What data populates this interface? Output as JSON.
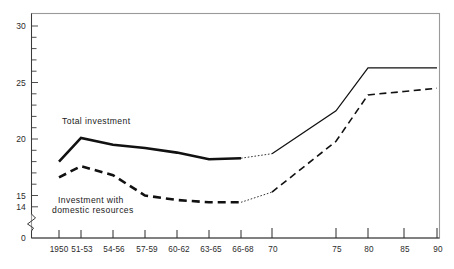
{
  "chart_data": {
    "type": "line",
    "title": "",
    "subtitle": "",
    "xlabel": "",
    "ylabel": "",
    "grid": false,
    "legend_position": "inline-annotation",
    "axis_break": true,
    "axis_break_note": "y-axis broken between 0 and 14",
    "ylim": [
      14,
      31
    ],
    "yticks_labeled": [
      "30",
      "25",
      "20",
      "15",
      "14",
      "0"
    ],
    "ytick_values": [
      30,
      25,
      20,
      15,
      14,
      0
    ],
    "ytick_minor_step": 1,
    "x": [
      "1950",
      "51-53",
      "54-56",
      "57-59",
      "60-62",
      "63-65",
      "66-68",
      "70",
      "75",
      "80",
      "85",
      "90"
    ],
    "categories": [
      "1950",
      "51-53",
      "54-56",
      "57-59",
      "60-62",
      "63-65",
      "66-68",
      "70",
      "75",
      "80",
      "85",
      "90"
    ],
    "series": [
      {
        "name": "Total investment",
        "style": "solid-thick-then-thin",
        "values": [
          18.0,
          20.1,
          19.5,
          19.2,
          18.8,
          18.2,
          18.3,
          18.7,
          22.5,
          26.3,
          26.3,
          26.3
        ]
      },
      {
        "name": "Investment with domestic resources",
        "style": "dashed",
        "values": [
          16.6,
          17.6,
          16.8,
          15.0,
          14.6,
          14.4,
          14.4,
          15.3,
          19.8,
          23.9,
          24.2,
          24.5
        ]
      }
    ],
    "annotations": [
      {
        "text": "Total investment",
        "x_frac": 0.12,
        "y_value": 21.6
      },
      {
        "text": "Investment with",
        "x_frac": 0.13,
        "y_value": 14.9
      },
      {
        "text": "domestic  resources",
        "x_frac": 0.115,
        "y_value": 14.1
      }
    ]
  },
  "colors": {
    "line": "#111111",
    "frame": "#9a9a9a",
    "axis": "#3a3a3a",
    "text": "#2b2b2b",
    "background": "#ffffff"
  },
  "labels": {
    "series_total": "Total investment",
    "series_domestic_line1": "Investment  with",
    "series_domestic_line2": "domestic  resources",
    "y_30": "30",
    "y_25": "25",
    "y_20": "20",
    "y_15": "15",
    "y_14": "14",
    "y_0": "0",
    "x_1950": "1950",
    "x_5153": "51-53",
    "x_5456": "54-56",
    "x_5759": "57-59",
    "x_6062": "60-62",
    "x_6365": "63-65",
    "x_6668": "66-68",
    "x_70": "70",
    "x_75": "75",
    "x_80": "80",
    "x_85": "85",
    "x_90": "90"
  }
}
